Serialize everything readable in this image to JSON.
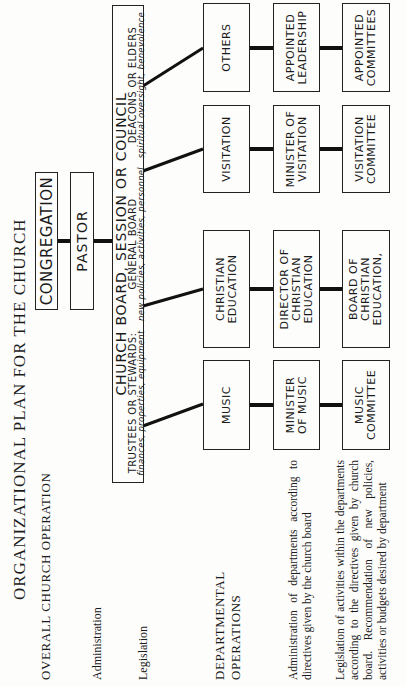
{
  "title": "ORGANIZATIONAL PLAN FOR THE CHURCH",
  "left_column": {
    "overall_heading": "OVERALL CHURCH OPERATION",
    "administration_label": "Administration",
    "legislation_label": "Legislation",
    "departmental_heading_line1": "DEPARTMENTAL",
    "departmental_heading_line2": "OPERATIONS",
    "dept_admin_desc": "Administration of departments according to directives given by the church board",
    "dept_legislation_desc": "Legislation of activities within the departments according to the directives given by church board. Recommendation of new policies, activities or budgets desired by department"
  },
  "top_chart": {
    "congregation": "CONGREGATION",
    "pastor": "PASTOR"
  },
  "church_board": {
    "title": "CHURCH BOARD, SESSION OR COUNCIL",
    "trustees_title": "TRUSTEES OR STEWARDS:",
    "trustees_duties": "finances, properties, equipment",
    "general_title": "GENERAL BOARD",
    "general_duties": "new policies, activities, personnel",
    "deacons_title": "DEACONS OR ELDERS",
    "deacons_duties": "spiritual oversight, benevolence"
  },
  "departments": [
    {
      "department": "MUSIC",
      "leader": "MINISTER OF MUSIC",
      "committee": "MUSIC COMMITTEE"
    },
    {
      "department": "CHRISTIAN EDUCATION",
      "leader": "DIRECTOR OF CHRISTIAN EDUCATION",
      "committee": "BOARD OF CHRISTIAN EDUCATION,"
    },
    {
      "department": "VISITATION",
      "leader": "MINISTER OF VISITATION",
      "committee": "VISITATION COMMITTEE"
    },
    {
      "department": "OTHERS",
      "leader": "APPOINTED LEADERSHIP",
      "committee": "APPOINTED COMMITTEES"
    }
  ],
  "colors": {
    "ink": "#1a1a1a",
    "paper": "#fdfdfc"
  }
}
